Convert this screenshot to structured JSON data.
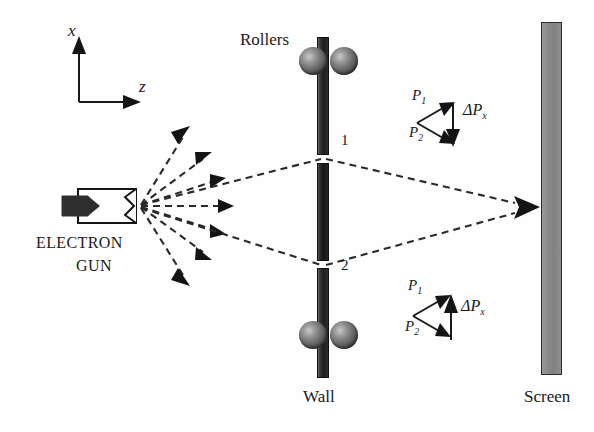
{
  "figure": {
    "background": "#ffffff"
  },
  "axes": {
    "x_label": "x",
    "z_label": "z",
    "x_direction": "up",
    "z_direction": "right"
  },
  "source": {
    "name": "electron-gun",
    "label_line1": "ELECTRON",
    "label_line2": "GUN",
    "emitted_rays": 7
  },
  "wall": {
    "label": "Wall",
    "color": "#222222",
    "segments": 3,
    "slits": [
      {
        "id": "1",
        "label": "1"
      },
      {
        "id": "2",
        "label": "2"
      }
    ]
  },
  "rollers": {
    "label": "Rollers",
    "count": 4,
    "color": "#6e6e6e"
  },
  "screen": {
    "label": "Screen",
    "color": "#838383"
  },
  "momentum_diagrams": [
    {
      "position": "upper",
      "p1_label": "P",
      "p1_sub": "1",
      "p2_label": "P",
      "p2_sub": "2",
      "delta_label": "ΔP",
      "delta_sub": "x",
      "delta_direction": "down"
    },
    {
      "position": "lower",
      "p1_label": "P",
      "p1_sub": "1",
      "p2_label": "P",
      "p2_sub": "2",
      "delta_label": "ΔP",
      "delta_sub": "x",
      "delta_direction": "up"
    }
  ],
  "colors": {
    "ink": "#1a1a1a",
    "wall_dark": "#1f1f1f",
    "screen_gray": "#838383",
    "roller_gray": "#6e6e6e",
    "dashed_ray": "#2a2a2a"
  }
}
